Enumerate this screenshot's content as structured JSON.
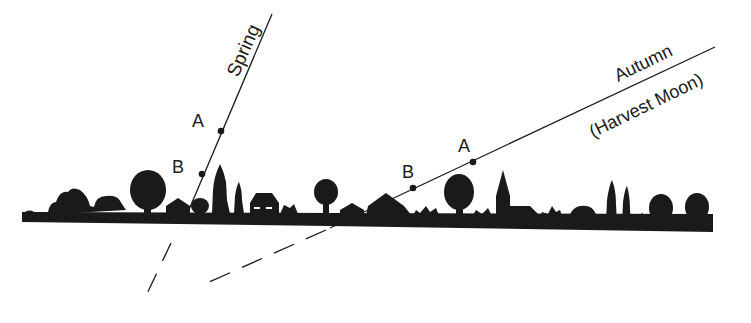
{
  "diagram": {
    "colors": {
      "ink": "#1a1a1a",
      "background": "#ffffff"
    },
    "paths": [
      {
        "id": "spring",
        "label": "Spring",
        "points": [
          {
            "label": "A"
          },
          {
            "label": "B"
          }
        ]
      },
      {
        "id": "autumn",
        "label": "Autumn",
        "sublabel": "(Harvest Moon)",
        "points": [
          {
            "label": "A"
          },
          {
            "label": "B"
          }
        ]
      }
    ],
    "horizon": {
      "label": "horizon silhouette (trees, houses, church steeple)"
    }
  }
}
